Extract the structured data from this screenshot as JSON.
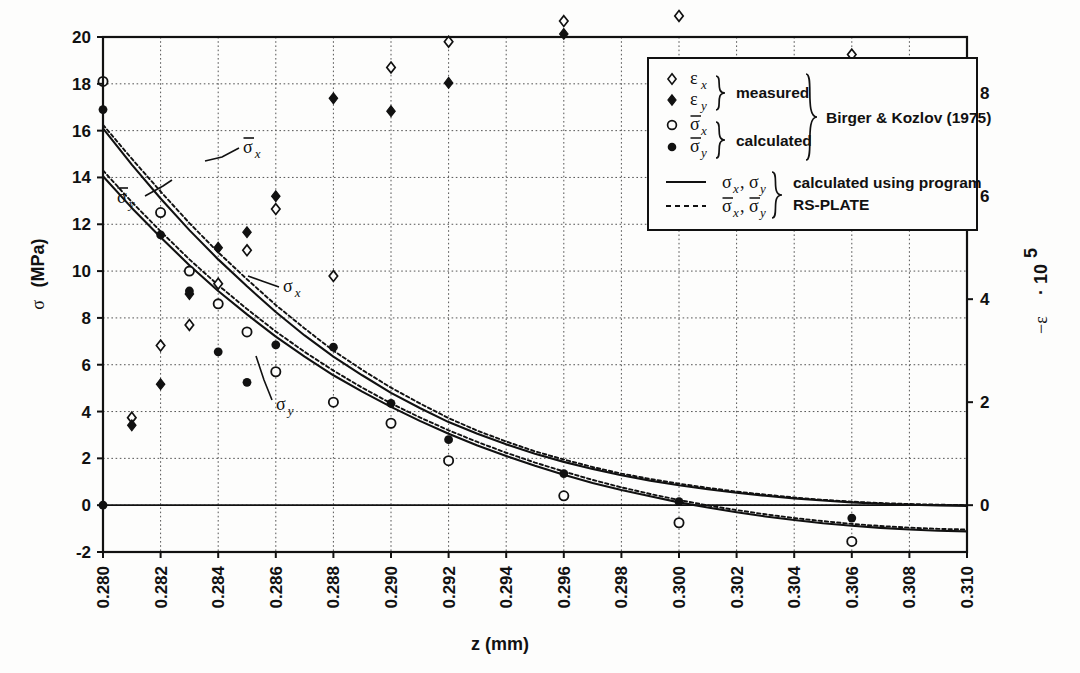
{
  "chart_data": {
    "type": "scatter",
    "title": "",
    "xlabel": "z (mm)",
    "ylabel_left": "σ  (MPa)",
    "ylabel_right": "−ε · 10^5",
    "ylabel_right_parts": {
      "minus": "−",
      "eps": "ε",
      "dot": "·",
      "ten": "10",
      "exp": "5"
    },
    "xlim": [
      0.28,
      0.31
    ],
    "ylim_left": [
      -2,
      20
    ],
    "ylim_right": [
      -0.909090909,
      9.0909090909
    ],
    "xticks": [
      "0.280",
      "0.282",
      "0.284",
      "0.286",
      "0.288",
      "0.290",
      "0.292",
      "0.294",
      "0.296",
      "0.298",
      "0.300",
      "0.302",
      "0.304",
      "0.306",
      "0.308",
      "0.310"
    ],
    "xtick_values": [
      0.28,
      0.282,
      0.284,
      0.286,
      0.288,
      0.29,
      0.292,
      0.294,
      0.296,
      0.298,
      0.3,
      0.302,
      0.304,
      0.306,
      0.308,
      0.31
    ],
    "yticks_left": [
      "-2",
      "0",
      "2",
      "4",
      "6",
      "8",
      "10",
      "12",
      "14",
      "16",
      "18",
      "20"
    ],
    "ytick_left_values": [
      -2,
      0,
      2,
      4,
      6,
      8,
      10,
      12,
      14,
      16,
      18,
      20
    ],
    "yticks_right": [
      "0",
      "2",
      "4",
      "6",
      "8",
      "10"
    ],
    "ytick_right_values": [
      0,
      2,
      4,
      6,
      8,
      10
    ],
    "grid": true,
    "grid_style": "dotted",
    "legend_position": "top-right-inside-box",
    "series": [
      {
        "name": "eps_x_measured",
        "symbol": "open-diamond",
        "marker_label": "ε_x",
        "group": "measured",
        "axis": "right",
        "points": [
          [
            0.281,
            1.7
          ],
          [
            0.282,
            3.1
          ],
          [
            0.283,
            3.5
          ],
          [
            0.284,
            4.3
          ],
          [
            0.285,
            4.95
          ],
          [
            0.286,
            5.75
          ],
          [
            0.288,
            4.45
          ],
          [
            0.29,
            8.5
          ],
          [
            0.292,
            9.0
          ],
          [
            0.296,
            9.4
          ],
          [
            0.3,
            9.5
          ],
          [
            0.306,
            8.75
          ]
        ]
      },
      {
        "name": "eps_y_measured",
        "symbol": "filled-diamond",
        "marker_label": "ε_y",
        "group": "measured",
        "axis": "right",
        "points": [
          [
            0.281,
            1.55
          ],
          [
            0.282,
            2.35
          ],
          [
            0.283,
            4.1
          ],
          [
            0.284,
            5.0
          ],
          [
            0.285,
            5.3
          ],
          [
            0.286,
            6.0
          ],
          [
            0.288,
            7.9
          ],
          [
            0.29,
            7.65
          ],
          [
            0.292,
            8.2
          ],
          [
            0.296,
            9.15
          ],
          [
            0.3,
            10.3
          ],
          [
            0.306,
            10.35
          ]
        ]
      },
      {
        "name": "sigma_bar_x_calculated",
        "symbol": "open-circle",
        "marker_label": "σ̄_x",
        "group": "calculated",
        "axis": "left",
        "points": [
          [
            0.28,
            18.1
          ],
          [
            0.282,
            12.5
          ],
          [
            0.283,
            10.0
          ],
          [
            0.284,
            8.6
          ],
          [
            0.285,
            7.4
          ],
          [
            0.286,
            5.7
          ],
          [
            0.288,
            4.4
          ],
          [
            0.29,
            3.5
          ],
          [
            0.292,
            1.9
          ],
          [
            0.296,
            0.4
          ],
          [
            0.3,
            -0.75
          ],
          [
            0.306,
            -1.55
          ]
        ]
      },
      {
        "name": "sigma_bar_y_calculated",
        "symbol": "filled-circle",
        "marker_label": "σ̄_y",
        "group": "calculated",
        "axis": "left",
        "points": [
          [
            0.28,
            16.9
          ],
          [
            0.28,
            0.0
          ],
          [
            0.282,
            11.55
          ],
          [
            0.283,
            9.15
          ],
          [
            0.284,
            6.55
          ],
          [
            0.285,
            5.25
          ],
          [
            0.286,
            6.85
          ],
          [
            0.288,
            6.75
          ],
          [
            0.29,
            4.35
          ],
          [
            0.292,
            2.8
          ],
          [
            0.296,
            1.35
          ],
          [
            0.3,
            0.15
          ],
          [
            0.306,
            -0.55
          ]
        ]
      }
    ],
    "curves": [
      {
        "name": "sigma_x_solid",
        "label": "σx",
        "style": "solid",
        "axis": "left",
        "points": [
          [
            0.28,
            16.1
          ],
          [
            0.281,
            14.55
          ],
          [
            0.282,
            13.1
          ],
          [
            0.283,
            11.75
          ],
          [
            0.284,
            10.5
          ],
          [
            0.285,
            9.35
          ],
          [
            0.286,
            8.25
          ],
          [
            0.287,
            7.25
          ],
          [
            0.288,
            6.35
          ],
          [
            0.289,
            5.55
          ],
          [
            0.29,
            4.8
          ],
          [
            0.291,
            4.15
          ],
          [
            0.292,
            3.55
          ],
          [
            0.293,
            3.05
          ],
          [
            0.294,
            2.6
          ],
          [
            0.295,
            2.2
          ],
          [
            0.296,
            1.85
          ],
          [
            0.297,
            1.55
          ],
          [
            0.298,
            1.28
          ],
          [
            0.299,
            1.05
          ],
          [
            0.3,
            0.85
          ],
          [
            0.301,
            0.68
          ],
          [
            0.302,
            0.53
          ],
          [
            0.303,
            0.4
          ],
          [
            0.304,
            0.29
          ],
          [
            0.305,
            0.2
          ],
          [
            0.306,
            0.12
          ],
          [
            0.307,
            0.06
          ],
          [
            0.308,
            0.02
          ],
          [
            0.309,
            -0.01
          ],
          [
            0.31,
            -0.03
          ]
        ]
      },
      {
        "name": "sigma_y_solid",
        "label": "σy",
        "style": "solid",
        "axis": "left",
        "points": [
          [
            0.28,
            14.05
          ],
          [
            0.281,
            12.7
          ],
          [
            0.282,
            11.45
          ],
          [
            0.283,
            10.25
          ],
          [
            0.284,
            9.15
          ],
          [
            0.285,
            8.15
          ],
          [
            0.286,
            7.2
          ],
          [
            0.287,
            6.35
          ],
          [
            0.288,
            5.55
          ],
          [
            0.289,
            4.85
          ],
          [
            0.29,
            4.2
          ],
          [
            0.291,
            3.6
          ],
          [
            0.292,
            3.05
          ],
          [
            0.293,
            2.55
          ],
          [
            0.294,
            2.1
          ],
          [
            0.295,
            1.68
          ],
          [
            0.296,
            1.3
          ],
          [
            0.297,
            0.95
          ],
          [
            0.298,
            0.65
          ],
          [
            0.299,
            0.38
          ],
          [
            0.3,
            0.12
          ],
          [
            0.301,
            -0.1
          ],
          [
            0.302,
            -0.3
          ],
          [
            0.303,
            -0.48
          ],
          [
            0.304,
            -0.63
          ],
          [
            0.305,
            -0.77
          ],
          [
            0.306,
            -0.88
          ],
          [
            0.307,
            -0.97
          ],
          [
            0.308,
            -1.04
          ],
          [
            0.309,
            -1.09
          ],
          [
            0.31,
            -1.12
          ]
        ]
      },
      {
        "name": "sigma_bar_x_dashed",
        "label": "σ̄x",
        "style": "dashed",
        "axis": "left",
        "points": [
          [
            0.28,
            16.25
          ],
          [
            0.281,
            14.8
          ],
          [
            0.282,
            13.4
          ],
          [
            0.283,
            12.05
          ],
          [
            0.284,
            10.8
          ],
          [
            0.285,
            9.65
          ],
          [
            0.286,
            8.55
          ],
          [
            0.287,
            7.55
          ],
          [
            0.288,
            6.6
          ],
          [
            0.289,
            5.78
          ],
          [
            0.29,
            5.02
          ],
          [
            0.291,
            4.35
          ],
          [
            0.292,
            3.72
          ],
          [
            0.293,
            3.18
          ],
          [
            0.294,
            2.72
          ],
          [
            0.295,
            2.3
          ],
          [
            0.296,
            1.95
          ],
          [
            0.297,
            1.63
          ],
          [
            0.298,
            1.35
          ],
          [
            0.299,
            1.12
          ],
          [
            0.3,
            0.92
          ],
          [
            0.301,
            0.74
          ],
          [
            0.302,
            0.58
          ],
          [
            0.303,
            0.45
          ],
          [
            0.304,
            0.33
          ],
          [
            0.305,
            0.23
          ],
          [
            0.306,
            0.15
          ],
          [
            0.307,
            0.09
          ],
          [
            0.308,
            0.05
          ],
          [
            0.309,
            0.02
          ],
          [
            0.31,
            0.0
          ]
        ]
      },
      {
        "name": "sigma_bar_y_dashed",
        "label": "σ̄y",
        "style": "dashed",
        "axis": "left",
        "points": [
          [
            0.28,
            14.3
          ],
          [
            0.281,
            12.95
          ],
          [
            0.282,
            11.7
          ],
          [
            0.283,
            10.5
          ],
          [
            0.284,
            9.4
          ],
          [
            0.285,
            8.38
          ],
          [
            0.286,
            7.42
          ],
          [
            0.287,
            6.55
          ],
          [
            0.288,
            5.75
          ],
          [
            0.289,
            5.02
          ],
          [
            0.29,
            4.35
          ],
          [
            0.291,
            3.75
          ],
          [
            0.292,
            3.2
          ],
          [
            0.293,
            2.7
          ],
          [
            0.294,
            2.24
          ],
          [
            0.295,
            1.82
          ],
          [
            0.296,
            1.44
          ],
          [
            0.297,
            1.08
          ],
          [
            0.298,
            0.76
          ],
          [
            0.299,
            0.48
          ],
          [
            0.3,
            0.22
          ],
          [
            0.301,
            -0.01
          ],
          [
            0.302,
            -0.21
          ],
          [
            0.303,
            -0.39
          ],
          [
            0.304,
            -0.55
          ],
          [
            0.305,
            -0.68
          ],
          [
            0.306,
            -0.8
          ],
          [
            0.307,
            -0.89
          ],
          [
            0.308,
            -0.96
          ],
          [
            0.309,
            -1.01
          ],
          [
            0.31,
            -1.04
          ]
        ]
      }
    ],
    "annotations": [
      {
        "name": "sigma-bar-x-callout",
        "text": "σ̄x",
        "x": 0.2838,
        "y": 13.0
      },
      {
        "name": "sigma-bar-y-callout",
        "text": "σ̄y",
        "x": 0.2808,
        "y": 10.6
      },
      {
        "name": "sigma-x-callout",
        "text": "σx",
        "x": 0.2858,
        "y": 9.1
      },
      {
        "name": "sigma-y-callout",
        "text": "σy",
        "x": 0.2862,
        "y": 4.2
      }
    ]
  },
  "legend": {
    "rows": [
      {
        "symbol": "open-diamond",
        "label_base": "ε",
        "label_sub": "x"
      },
      {
        "symbol": "filled-diamond",
        "label_base": "ε",
        "label_sub": "y"
      },
      {
        "symbol": "open-circle",
        "label_base": "σ",
        "label_sub": "x",
        "overbar": true
      },
      {
        "symbol": "filled-circle",
        "label_base": "σ",
        "label_sub": "y",
        "overbar": true
      }
    ],
    "group_measured": "measured",
    "group_calculated": "calculated",
    "source": "Birger & Kozlov (1975)",
    "line_rows": [
      {
        "style": "solid",
        "label": "σx , σy"
      },
      {
        "style": "dashed",
        "label": "σ̄x , σ̄y"
      }
    ],
    "program_line1": "calculated using program",
    "program_line2": "RS-PLATE"
  },
  "axes": {
    "x_title": "z (mm)",
    "y_left_title_sigma": "σ",
    "y_left_title_unit": "(MPa)",
    "y_right_minus": "−",
    "y_right_eps": "ε",
    "y_right_mid": " · 10",
    "y_right_exp": "5"
  },
  "colors": {
    "ink": "#111111",
    "grid": "#555555",
    "background": "#fdfdfc"
  }
}
